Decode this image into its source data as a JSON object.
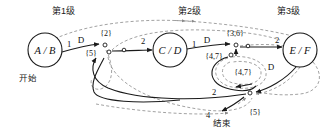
{
  "diagram": {
    "type": "state-transition-net",
    "title_present": false,
    "background": "#ffffff",
    "stroke_solid": "#1a1a1a",
    "stroke_dashed": "#8a8a8a",
    "level_headers": [
      {
        "id": "level-1",
        "text": "第1级",
        "x": 70,
        "y": 9
      },
      {
        "id": "level-2",
        "text": "第2级",
        "x": 196,
        "y": 9
      },
      {
        "id": "level-3",
        "text": "第3级",
        "x": 295,
        "y": 9
      }
    ],
    "places": [
      {
        "id": "place-ab",
        "label": "A / B",
        "cx": 45,
        "cy": 50,
        "r": 17
      },
      {
        "id": "place-cd",
        "label": "C / D",
        "cx": 170,
        "cy": 50,
        "r": 17
      },
      {
        "id": "place-ef",
        "label": "E / F",
        "cx": 300,
        "cy": 50,
        "r": 17
      }
    ],
    "annotations": [
      {
        "id": "start-label",
        "text": "开始",
        "x": 28,
        "y": 77,
        "kind": "chinese"
      },
      {
        "id": "end-label",
        "text": "结束",
        "x": 219,
        "y": 122,
        "kind": "chinese"
      }
    ],
    "edge_labels": [
      {
        "id": "label-ab-out-weight",
        "text": "1",
        "x": 69,
        "y": 45
      },
      {
        "id": "label-ab-out-d",
        "text": "D",
        "x": 80,
        "y": 41
      },
      {
        "id": "label-cd-in-weight",
        "text": "2",
        "x": 143,
        "y": 42
      },
      {
        "id": "label-cd-out-weight",
        "text": "1",
        "x": 194,
        "y": 45
      },
      {
        "id": "label-cd-out-d",
        "text": "D",
        "x": 206,
        "y": 41
      },
      {
        "id": "label-ef-in-weight",
        "text": "2",
        "x": 276,
        "y": 41
      },
      {
        "id": "label-ef-out-d",
        "text": "D",
        "x": 270,
        "y": 67
      },
      {
        "id": "label-return-weight",
        "text": "2",
        "x": 214,
        "y": 92
      },
      {
        "id": "label-end-weight",
        "text": "4",
        "x": 208,
        "y": 115
      }
    ],
    "set_labels": [
      {
        "id": "set-2",
        "text": "{2}",
        "x": 106,
        "y": 33
      },
      {
        "id": "set-5-left",
        "text": "{5}",
        "x": 91,
        "y": 53
      },
      {
        "id": "set-36",
        "text": "{3,6}",
        "x": 234,
        "y": 33
      },
      {
        "id": "set-47-left",
        "text": "{4,7}",
        "x": 214,
        "y": 55
      },
      {
        "id": "set-47-center",
        "text": "{4,7}",
        "x": 243,
        "y": 72
      },
      {
        "id": "set-5-bottom",
        "text": "{5}",
        "x": 254,
        "y": 112
      }
    ],
    "transitions": [
      {
        "id": "transition-t1",
        "x": 105,
        "y": 46
      },
      {
        "id": "transition-t2",
        "x": 108,
        "y": 53
      },
      {
        "id": "transition-t3",
        "x": 236,
        "y": 46
      },
      {
        "id": "transition-t4",
        "x": 232,
        "y": 55
      },
      {
        "id": "transition-t5",
        "x": 250,
        "y": 93
      }
    ]
  }
}
